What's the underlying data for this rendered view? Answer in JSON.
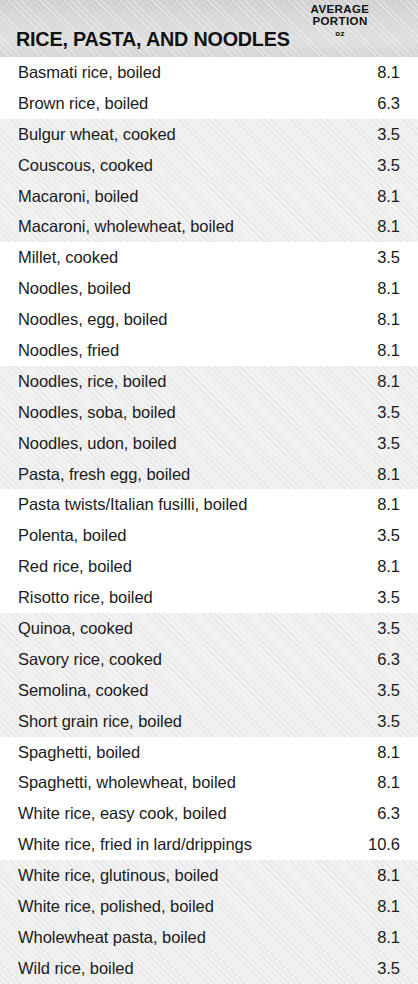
{
  "header": {
    "title": "RICE, PASTA, AND NOODLES",
    "measure_line1": "AVERAGE",
    "measure_line2": "PORTION",
    "unit": "oz"
  },
  "colors": {
    "header_background": "#d9d9d9",
    "shaded_row_background": "#f2f2f2",
    "plain_row_background": "#ffffff",
    "text": "#1b1b1b",
    "title_text": "#111111"
  },
  "table": {
    "columns": [
      "RICE, PASTA, AND NOODLES",
      "AVERAGE PORTION oz"
    ],
    "band_group_size": 4,
    "rows": [
      {
        "label": "Basmati rice, boiled",
        "value": "8.1",
        "shaded": false
      },
      {
        "label": "Brown rice, boiled",
        "value": "6.3",
        "shaded": false
      },
      {
        "label": "Bulgur wheat, cooked",
        "value": "3.5",
        "shaded": true
      },
      {
        "label": "Couscous, cooked",
        "value": "3.5",
        "shaded": true
      },
      {
        "label": "Macaroni, boiled",
        "value": "8.1",
        "shaded": true
      },
      {
        "label": "Macaroni, wholewheat, boiled",
        "value": "8.1",
        "shaded": true
      },
      {
        "label": "Millet, cooked",
        "value": "3.5",
        "shaded": false
      },
      {
        "label": "Noodles, boiled",
        "value": "8.1",
        "shaded": false
      },
      {
        "label": "Noodles, egg, boiled",
        "value": "8.1",
        "shaded": false
      },
      {
        "label": "Noodles, fried",
        "value": "8.1",
        "shaded": false
      },
      {
        "label": "Noodles, rice, boiled",
        "value": "8.1",
        "shaded": true
      },
      {
        "label": "Noodles, soba, boiled",
        "value": "3.5",
        "shaded": true
      },
      {
        "label": "Noodles, udon, boiled",
        "value": "3.5",
        "shaded": true
      },
      {
        "label": "Pasta, fresh egg, boiled",
        "value": "8.1",
        "shaded": true
      },
      {
        "label": "Pasta twists/Italian fusilli, boiled",
        "value": "8.1",
        "shaded": false
      },
      {
        "label": "Polenta, boiled",
        "value": "3.5",
        "shaded": false
      },
      {
        "label": "Red rice, boiled",
        "value": "8.1",
        "shaded": false
      },
      {
        "label": "Risotto rice, boiled",
        "value": "3.5",
        "shaded": false
      },
      {
        "label": "Quinoa, cooked",
        "value": "3.5",
        "shaded": true
      },
      {
        "label": "Savory rice, cooked",
        "value": "6.3",
        "shaded": true
      },
      {
        "label": "Semolina, cooked",
        "value": "3.5",
        "shaded": true
      },
      {
        "label": "Short grain rice, boiled",
        "value": "3.5",
        "shaded": true
      },
      {
        "label": "Spaghetti, boiled",
        "value": "8.1",
        "shaded": false
      },
      {
        "label": "Spaghetti, wholewheat, boiled",
        "value": "8.1",
        "shaded": false
      },
      {
        "label": "White rice, easy cook, boiled",
        "value": "6.3",
        "shaded": false
      },
      {
        "label": "White rice, fried in lard/drippings",
        "value": "10.6",
        "shaded": false
      },
      {
        "label": "White rice, glutinous, boiled",
        "value": "8.1",
        "shaded": true
      },
      {
        "label": "White rice, polished, boiled",
        "value": "8.1",
        "shaded": true
      },
      {
        "label": "Wholewheat pasta, boiled",
        "value": "8.1",
        "shaded": true
      },
      {
        "label": "Wild rice, boiled",
        "value": "3.5",
        "shaded": true
      }
    ]
  }
}
